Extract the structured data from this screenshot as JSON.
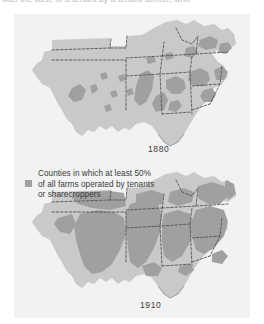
{
  "caption": {
    "text": "was the case of a tenant by a tenant farmer, who"
  },
  "figure": {
    "legend": {
      "swatch_color": "#a0a0a0",
      "lines": [
        "Counties in which at least 50%",
        "of all farms  operated by tenants",
        "or sharecroppers"
      ]
    },
    "maps": [
      {
        "id": "map-1880",
        "year_label": "1880",
        "region": "Southern United States",
        "land_color": "#c9c9c9",
        "shade_color": "#a0a0a0",
        "border_color": "#4a4a4a"
      },
      {
        "id": "map-1910",
        "year_label": "1910",
        "region": "Southern United States",
        "land_color": "#c9c9c9",
        "shade_color": "#a0a0a0",
        "border_color": "#4a4a4a"
      }
    ]
  }
}
